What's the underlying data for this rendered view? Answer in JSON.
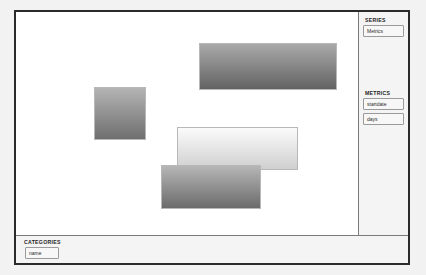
{
  "window": {
    "title": ""
  },
  "canvas": {
    "name": "chart-canvas",
    "background": "#ffffff",
    "shapes": [
      {
        "id": "shape-1",
        "label": "",
        "x": 78,
        "y": 75,
        "width": 52,
        "height": 53,
        "gradient_top": "#b4b4b4",
        "gradient_bottom": "#6f6f6f"
      },
      {
        "id": "shape-2",
        "label": "",
        "x": 183,
        "y": 31,
        "width": 138,
        "height": 47,
        "gradient_top": "#a9a9a9",
        "gradient_bottom": "#636363"
      },
      {
        "id": "shape-3",
        "label": "",
        "x": 161,
        "y": 115,
        "width": 121,
        "height": 43,
        "gradient_top": "#fbfbfb",
        "gradient_bottom": "#cfcfcf"
      },
      {
        "id": "shape-4",
        "label": "",
        "x": 145,
        "y": 153,
        "width": 100,
        "height": 44,
        "gradient_top": "#b6b6b6",
        "gradient_bottom": "#6b6b6b"
      }
    ]
  },
  "right_sidebar": {
    "panels": [
      {
        "title": "SERIES",
        "chips": [
          {
            "label": "Metrics"
          }
        ]
      },
      {
        "title": "METRICS",
        "chips": [
          {
            "label": "startdate"
          },
          {
            "label": "days"
          }
        ]
      }
    ]
  },
  "bottom_panel": {
    "title": "CATEGORIES",
    "chips": [
      {
        "label": "name"
      }
    ]
  },
  "colors": {
    "window_border": "#2b2b2b",
    "panel_background": "#f4f4f4",
    "panel_divider": "#7a7a7a",
    "chip_border": "#9a9a9a",
    "chip_background": "#f7f7f7",
    "text": "#1c1c1c"
  }
}
